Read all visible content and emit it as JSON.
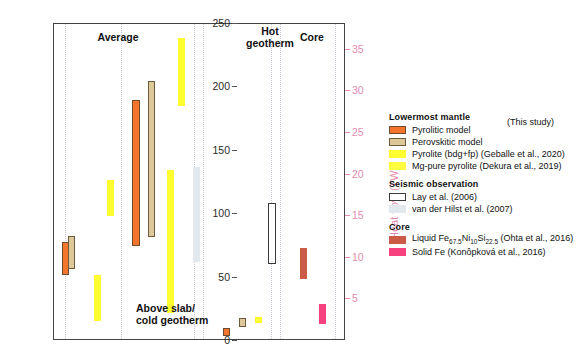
{
  "axes": {
    "left": {
      "label_html": "Heat flux (mW/m<sup>2</sup>)",
      "label_text": "Heat flux (mW/m2)",
      "ticks": [
        0,
        50,
        100,
        150,
        200,
        250
      ],
      "min": 0,
      "max": 250,
      "color": "#1a1a1a"
    },
    "right": {
      "label_text": "Heat flow (TW)",
      "ticks": [
        5,
        10,
        15,
        20,
        25,
        30,
        35
      ],
      "min": 0,
      "max": 38.1,
      "color": "#e48bb0"
    }
  },
  "group_labels": {
    "average": "Average",
    "above_slab": "Above slab/\ncold geotherm",
    "hot_geotherm": "Hot\ngeotherm",
    "core": "Core"
  },
  "legend": {
    "this_study": "(This study)",
    "sections": [
      {
        "title": "Lowermost mantle",
        "entries": [
          {
            "label": "Pyrolitic model",
            "color": "#f4762c",
            "border": "#6b4a30",
            "style": "filled"
          },
          {
            "label": "Perovskitic model",
            "color": "#ddc89a",
            "border": "#6b5a3c",
            "style": "filled"
          },
          {
            "label": "Pyrolite (bdg+fp) (Geballe et al., 2020)",
            "color": "#fdfd2f",
            "border": "none",
            "style": "filled"
          },
          {
            "label": "Mg-pure pyrolite (Dekura et al., 2019)",
            "color": "#fdfd3f",
            "border": "none",
            "style": "filled"
          }
        ]
      },
      {
        "title": "Seismic observation",
        "entries": [
          {
            "label": "Lay et al. (2006)",
            "color": "#ffffff",
            "border": "#3a3a3a",
            "style": "outline"
          },
          {
            "label": "van der Hilst et al. (2007)",
            "color": "#e2e9ee",
            "border": "none",
            "style": "filled"
          }
        ]
      },
      {
        "title": "Core",
        "entries": [
          {
            "label_pre": "Liquid Fe",
            "sub1": "67.5",
            "mid1": "Ni",
            "sub2": "10",
            "mid2": "Si",
            "sub3": "22.5",
            "label_post": " (Ohta et al., 2016)",
            "label": "Liquid Fe67.5Ni10Si22.5 (Ohta et al., 2016)",
            "color": "#cb5a46",
            "border": "none",
            "style": "filled"
          },
          {
            "label": "Solid Fe (Konôpková et al., 2016)",
            "color": "#f5427e",
            "border": "none",
            "style": "filled"
          }
        ]
      }
    ]
  },
  "chart_data": {
    "type": "bar",
    "title": "",
    "subtitle": "",
    "xlabel": "",
    "ylabel": "Heat flux (mW/m2)",
    "ylabel_secondary": "Heat flow (TW)",
    "ylim": [
      0,
      250
    ],
    "ylim_secondary": [
      0,
      38.1
    ],
    "grid": false,
    "legend_position": "right",
    "note": "Floating range bars (low-high interval) grouped by thermal scenario.",
    "groups": [
      {
        "name": "Average",
        "bars": [
          {
            "series": "Pyrolitic model",
            "low": 52,
            "high": 78,
            "color": "#f4762c",
            "border": "#6b4a30"
          },
          {
            "series": "Perovskitic model",
            "low": 57,
            "high": 83,
            "color": "#ddc89a",
            "border": "#6b5a3c"
          },
          {
            "series": "Pyrolite (bdg+fp) (Geballe et al., 2020)",
            "low": 99,
            "high": 127,
            "color": "#fdfd2f",
            "border": "none"
          },
          {
            "series": "Mg-pure pyrolite (Dekura et al., 2019)",
            "low": 16,
            "high": 52,
            "color": "#fdfd2f",
            "border": "none"
          }
        ]
      },
      {
        "name": "Above slab/cold geotherm",
        "bars": [
          {
            "series": "Pyrolitic model",
            "low": 75,
            "high": 190,
            "color": "#f4762c",
            "border": "#6b4a30"
          },
          {
            "series": "Perovskitic model",
            "low": 82,
            "high": 205,
            "color": "#ddc89a",
            "border": "#6b5a3c"
          },
          {
            "series": "Pyrolite (bdg+fp) (Geballe et al., 2020)",
            "low": 185,
            "high": 239,
            "color": "#fdfd2f",
            "border": "none"
          },
          {
            "series": "Mg-pure pyrolite (Dekura et al., 2019)",
            "low": 22,
            "high": 135,
            "color": "#fdfd2f",
            "border": "none"
          },
          {
            "series": "van der Hilst et al. (2007)",
            "low": 62,
            "high": 137,
            "color": "#e2e9ee",
            "border": "none"
          }
        ]
      },
      {
        "name": "Hot geotherm",
        "bars": [
          {
            "series": "Pyrolitic model",
            "low": 4,
            "high": 10,
            "color": "#f4762c",
            "border": "#6b4a30"
          },
          {
            "series": "Perovskitic model",
            "low": 11,
            "high": 18,
            "color": "#ddc89a",
            "border": "#6b5a3c"
          },
          {
            "series": "Mg-pure pyrolite (Dekura et al., 2019)",
            "low": 14,
            "high": 19,
            "color": "#fdfd2f",
            "border": "none"
          },
          {
            "series": "Lay et al. (2006)",
            "low": 61,
            "high": 109,
            "color": "#ffffff",
            "border": "#3a3a3a"
          }
        ]
      },
      {
        "name": "Core",
        "bars": [
          {
            "series": "Liquid Fe67.5Ni10Si22.5 (Ohta et al., 2016)",
            "low": 49,
            "high": 73,
            "color": "#cb5a46",
            "border": "none"
          },
          {
            "series": "Solid Fe (Konôpková et al., 2016)",
            "low": 13,
            "high": 29,
            "color": "#f5427e",
            "border": "none"
          }
        ]
      }
    ]
  }
}
